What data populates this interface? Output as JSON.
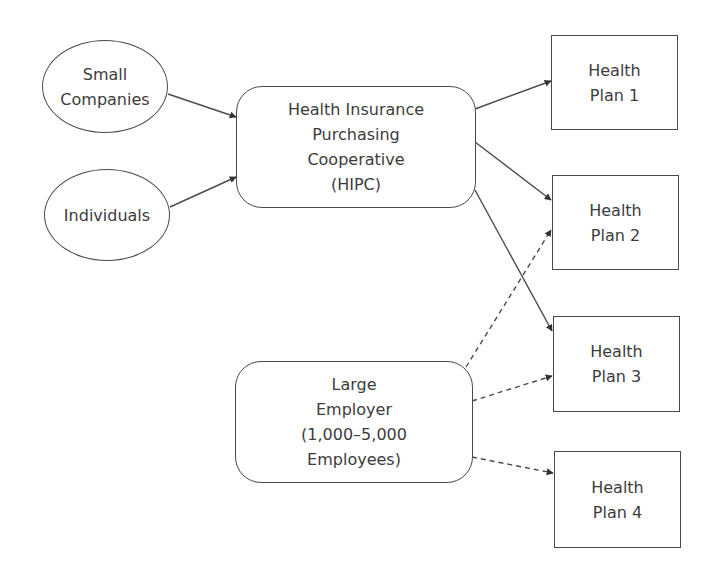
{
  "diagram": {
    "nodes": [
      {
        "id": "small-companies",
        "label": "Small\nCompanies",
        "shape": "ellipse"
      },
      {
        "id": "individuals",
        "label": "Individuals",
        "shape": "ellipse"
      },
      {
        "id": "hipc",
        "label": "Health Insurance\nPurchasing\nCooperative\n(HIPC)",
        "shape": "rounded-rect"
      },
      {
        "id": "large-employer",
        "label": "Large\nEmployer\n(1,000–5,000\nEmployees)",
        "shape": "rounded-rect"
      },
      {
        "id": "plan1",
        "label": "Health\nPlan 1",
        "shape": "rect"
      },
      {
        "id": "plan2",
        "label": "Health\nPlan 2",
        "shape": "rect"
      },
      {
        "id": "plan3",
        "label": "Health\nPlan 3",
        "shape": "rect"
      },
      {
        "id": "plan4",
        "label": "Health\nPlan 4",
        "shape": "rect"
      }
    ],
    "edges": [
      {
        "from": "small-companies",
        "to": "hipc",
        "style": "solid"
      },
      {
        "from": "individuals",
        "to": "hipc",
        "style": "solid"
      },
      {
        "from": "hipc",
        "to": "plan1",
        "style": "solid"
      },
      {
        "from": "hipc",
        "to": "plan2",
        "style": "solid"
      },
      {
        "from": "hipc",
        "to": "plan3",
        "style": "solid"
      },
      {
        "from": "large-employer",
        "to": "plan2",
        "style": "dashed"
      },
      {
        "from": "large-employer",
        "to": "plan3",
        "style": "dashed"
      },
      {
        "from": "large-employer",
        "to": "plan4",
        "style": "dashed"
      }
    ],
    "colors": {
      "stroke": "#4a4a4a",
      "text": "#3c3c3c",
      "background": "#ffffff"
    }
  }
}
